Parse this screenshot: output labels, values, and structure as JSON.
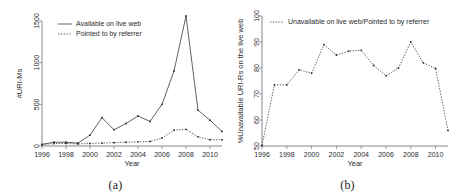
{
  "figure": {
    "panel_a_caption": "(a)",
    "panel_b_caption": "(b)"
  },
  "chart_data": [
    {
      "panel": "a",
      "type": "line",
      "title": "",
      "xlabel": "Year",
      "ylabel": "#URI-Ms",
      "xlim": [
        1996,
        2011
      ],
      "ylim": [
        0,
        1560
      ],
      "xticks": [
        1996,
        1998,
        2000,
        2002,
        2004,
        2006,
        2008,
        2010
      ],
      "xticklabels": [
        "1996",
        "1998",
        "2000",
        "2002",
        "2004",
        "2006",
        "2008",
        "2010"
      ],
      "yticks": [
        0,
        500,
        1000,
        1500
      ],
      "yticklabels": [
        "0",
        "500",
        "1000",
        "1500"
      ],
      "grid": false,
      "legend_position": "top-left",
      "x": [
        1996,
        1997,
        1998,
        1999,
        2000,
        2001,
        2002,
        2003,
        2004,
        2005,
        2006,
        2007,
        2008,
        2009,
        2010,
        2011
      ],
      "series": [
        {
          "name": "Available on live web",
          "style": "solid",
          "values": [
            20,
            45,
            45,
            35,
            130,
            340,
            195,
            270,
            360,
            295,
            500,
            900,
            1560,
            430,
            310,
            175
          ]
        },
        {
          "name": "Pointed to by referrer",
          "style": "dotted",
          "values": [
            15,
            30,
            30,
            25,
            30,
            35,
            40,
            45,
            50,
            55,
            95,
            190,
            200,
            110,
            75,
            75
          ]
        }
      ]
    },
    {
      "panel": "b",
      "type": "line",
      "title": "",
      "xlabel": "Year",
      "ylabel": "%Unavailable URI-Rs on the live web",
      "xlim": [
        1996,
        2011
      ],
      "ylim": [
        50,
        100
      ],
      "xticks": [
        1996,
        1998,
        2000,
        2002,
        2004,
        2006,
        2008,
        2010
      ],
      "xticklabels": [
        "1996",
        "1998",
        "2000",
        "2002",
        "2004",
        "2006",
        "2008",
        "2010"
      ],
      "yticks": [
        50,
        60,
        70,
        80,
        90,
        100
      ],
      "yticklabels": [
        "50",
        "60",
        "70",
        "80",
        "90",
        "100"
      ],
      "grid": false,
      "legend_position": "top-left",
      "x": [
        1996,
        1997,
        1998,
        1999,
        2000,
        2001,
        2002,
        2003,
        2004,
        2005,
        2006,
        2007,
        2008,
        2009,
        2010,
        2011
      ],
      "series": [
        {
          "name": "Unavailable on live web/Pointed to by referrer",
          "style": "dotted",
          "values": [
            50.2,
            73.5,
            73.5,
            79.3,
            78.0,
            89.0,
            85.0,
            86.5,
            86.8,
            81.0,
            77.0,
            80.0,
            90.0,
            82.0,
            79.8,
            56.0
          ]
        }
      ]
    }
  ]
}
